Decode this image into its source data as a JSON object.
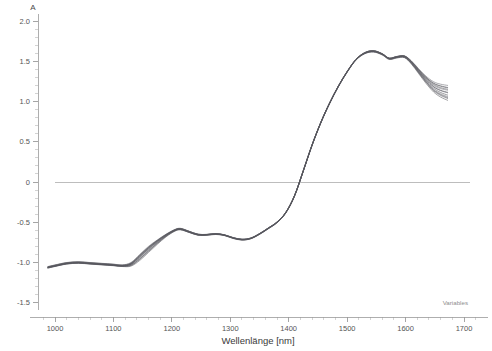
{
  "chart_data": {
    "type": "line",
    "title": "",
    "xlabel": "Wellenlänge [nm]",
    "ylabel": "A",
    "xlim": [
      960,
      1720
    ],
    "ylim": [
      -1.75,
      2.12
    ],
    "xticks": [
      1000,
      1100,
      1200,
      1300,
      1400,
      1500,
      1600,
      1700
    ],
    "xtick_labels": [
      "1000",
      "1100",
      "1200",
      "1300",
      "1400",
      "1500",
      "1600",
      "1700"
    ],
    "yticks": [
      2.0,
      1.5,
      1.0,
      0.5,
      0.0,
      -0.5,
      -1.0,
      -1.5
    ],
    "ytick_labels": [
      "2.0",
      "1.5",
      "1.0",
      "0.5",
      "0",
      "-0.5",
      "-1.0",
      "-1.5"
    ],
    "xminor_step": 20,
    "yminor_step": 0.1,
    "grid": false,
    "legend": false,
    "zero_reference_line": 0.0,
    "annotation": "Variables",
    "annotation_position": "bottom-right",
    "series_count": 12,
    "series_color": "#55555a",
    "x": [
      988,
      1000,
      1020,
      1040,
      1060,
      1080,
      1100,
      1115,
      1130,
      1145,
      1160,
      1175,
      1190,
      1205,
      1215,
      1230,
      1245,
      1260,
      1275,
      1290,
      1305,
      1320,
      1335,
      1350,
      1365,
      1380,
      1395,
      1410,
      1425,
      1440,
      1455,
      1470,
      1485,
      1500,
      1515,
      1530,
      1545,
      1560,
      1572,
      1585,
      1598,
      1610,
      1622,
      1635,
      1648,
      1660,
      1672
    ],
    "series": [
      {
        "name": "Spectrum 1",
        "values": [
          -1.06,
          -1.04,
          -1.01,
          -1.0,
          -1.01,
          -1.02,
          -1.03,
          -1.04,
          -1.02,
          -0.93,
          -0.83,
          -0.74,
          -0.66,
          -0.6,
          -0.585,
          -0.62,
          -0.655,
          -0.655,
          -0.645,
          -0.66,
          -0.695,
          -0.715,
          -0.7,
          -0.645,
          -0.575,
          -0.5,
          -0.38,
          -0.17,
          0.14,
          0.46,
          0.74,
          0.98,
          1.19,
          1.37,
          1.52,
          1.6,
          1.625,
          1.59,
          1.535,
          1.555,
          1.565,
          1.5,
          1.4,
          1.3,
          1.225,
          1.19,
          1.17
        ]
      },
      {
        "name": "Spectrum 2",
        "values": [
          -1.055,
          -1.035,
          -1.005,
          -0.995,
          -1.005,
          -1.015,
          -1.025,
          -1.035,
          -1.01,
          -0.915,
          -0.815,
          -0.73,
          -0.655,
          -0.595,
          -0.58,
          -0.615,
          -0.65,
          -0.652,
          -0.642,
          -0.658,
          -0.693,
          -0.713,
          -0.698,
          -0.642,
          -0.572,
          -0.497,
          -0.377,
          -0.167,
          0.143,
          0.462,
          0.742,
          0.982,
          1.192,
          1.372,
          1.522,
          1.605,
          1.63,
          1.592,
          1.537,
          1.557,
          1.562,
          1.49,
          1.385,
          1.275,
          1.185,
          1.14,
          1.115
        ]
      },
      {
        "name": "Spectrum 3",
        "values": [
          -1.065,
          -1.045,
          -1.015,
          -1.005,
          -1.015,
          -1.025,
          -1.035,
          -1.045,
          -1.03,
          -0.95,
          -0.85,
          -0.755,
          -0.67,
          -0.605,
          -0.59,
          -0.625,
          -0.658,
          -0.658,
          -0.648,
          -0.662,
          -0.698,
          -0.718,
          -0.702,
          -0.648,
          -0.578,
          -0.503,
          -0.383,
          -0.173,
          0.137,
          0.457,
          0.737,
          0.977,
          1.187,
          1.367,
          1.517,
          1.598,
          1.62,
          1.585,
          1.53,
          1.548,
          1.552,
          1.478,
          1.368,
          1.25,
          1.15,
          1.095,
          1.06
        ]
      },
      {
        "name": "Spectrum 4",
        "values": [
          -1.07,
          -1.05,
          -1.02,
          -1.01,
          -1.02,
          -1.03,
          -1.04,
          -1.05,
          -1.045,
          -0.975,
          -0.875,
          -0.775,
          -0.682,
          -0.612,
          -0.595,
          -0.628,
          -0.662,
          -0.662,
          -0.652,
          -0.666,
          -0.702,
          -0.722,
          -0.706,
          -0.652,
          -0.582,
          -0.507,
          -0.387,
          -0.177,
          0.133,
          0.452,
          0.732,
          0.972,
          1.182,
          1.362,
          1.512,
          1.592,
          1.615,
          1.578,
          1.522,
          1.54,
          1.545,
          1.465,
          1.35,
          1.225,
          1.118,
          1.055,
          1.015
        ]
      },
      {
        "name": "Spectrum 5",
        "values": [
          -1.05,
          -1.03,
          -1.0,
          -0.99,
          -1.0,
          -1.01,
          -1.02,
          -1.03,
          -1.0,
          -0.9,
          -0.8,
          -0.72,
          -0.648,
          -0.59,
          -0.575,
          -0.612,
          -0.648,
          -0.65,
          -0.64,
          -0.655,
          -0.69,
          -0.71,
          -0.695,
          -0.64,
          -0.57,
          -0.495,
          -0.375,
          -0.165,
          0.145,
          0.465,
          0.745,
          0.985,
          1.195,
          1.375,
          1.525,
          1.608,
          1.632,
          1.595,
          1.54,
          1.56,
          1.568,
          1.505,
          1.41,
          1.315,
          1.245,
          1.215,
          1.2
        ]
      },
      {
        "name": "Spectrum 6",
        "values": [
          -1.06,
          -1.042,
          -1.012,
          -1.002,
          -1.012,
          -1.022,
          -1.032,
          -1.042,
          -1.018,
          -0.925,
          -0.825,
          -0.738,
          -0.66,
          -0.598,
          -0.582,
          -0.618,
          -0.652,
          -0.654,
          -0.644,
          -0.659,
          -0.694,
          -0.714,
          -0.699,
          -0.644,
          -0.574,
          -0.499,
          -0.379,
          -0.169,
          0.141,
          0.46,
          0.74,
          0.98,
          1.19,
          1.37,
          1.52,
          1.602,
          1.627,
          1.59,
          1.534,
          1.553,
          1.559,
          1.487,
          1.382,
          1.272,
          1.182,
          1.135,
          1.108
        ]
      },
      {
        "name": "Spectrum 7",
        "values": [
          -1.058,
          -1.038,
          -1.008,
          -0.998,
          -1.008,
          -1.018,
          -1.028,
          -1.038,
          -1.014,
          -0.92,
          -0.818,
          -0.732,
          -0.657,
          -0.596,
          -0.581,
          -0.616,
          -0.651,
          -0.653,
          -0.643,
          -0.657,
          -0.692,
          -0.712,
          -0.697,
          -0.643,
          -0.573,
          -0.498,
          -0.378,
          -0.168,
          0.142,
          0.461,
          0.741,
          0.981,
          1.191,
          1.371,
          1.521,
          1.604,
          1.629,
          1.591,
          1.536,
          1.556,
          1.561,
          1.492,
          1.39,
          1.285,
          1.2,
          1.16,
          1.14
        ]
      },
      {
        "name": "Spectrum 8",
        "values": [
          -1.068,
          -1.048,
          -1.018,
          -1.008,
          -1.018,
          -1.028,
          -1.038,
          -1.048,
          -1.038,
          -0.962,
          -0.862,
          -0.765,
          -0.676,
          -0.608,
          -0.592,
          -0.627,
          -0.66,
          -0.66,
          -0.65,
          -0.664,
          -0.7,
          -0.72,
          -0.704,
          -0.65,
          -0.58,
          -0.505,
          -0.385,
          -0.175,
          0.135,
          0.455,
          0.735,
          0.975,
          1.185,
          1.365,
          1.515,
          1.595,
          1.617,
          1.581,
          1.526,
          1.544,
          1.548,
          1.471,
          1.359,
          1.238,
          1.134,
          1.075,
          1.038
        ]
      },
      {
        "name": "Spectrum 9",
        "values": [
          -1.062,
          -1.044,
          -1.014,
          -1.004,
          -1.014,
          -1.024,
          -1.034,
          -1.044,
          -1.024,
          -0.938,
          -0.838,
          -0.748,
          -0.666,
          -0.602,
          -0.587,
          -0.622,
          -0.656,
          -0.656,
          -0.646,
          -0.66,
          -0.696,
          -0.716,
          -0.701,
          -0.646,
          -0.576,
          -0.501,
          -0.381,
          -0.171,
          0.139,
          0.458,
          0.738,
          0.978,
          1.188,
          1.368,
          1.518,
          1.6,
          1.622,
          1.587,
          1.532,
          1.55,
          1.555,
          1.482,
          1.374,
          1.26,
          1.165,
          1.112,
          1.08
        ]
      },
      {
        "name": "Spectrum 10",
        "values": [
          -1.052,
          -1.032,
          -1.002,
          -0.992,
          -1.002,
          -1.012,
          -1.022,
          -1.032,
          -1.005,
          -0.908,
          -0.808,
          -0.725,
          -0.652,
          -0.592,
          -0.578,
          -0.614,
          -0.649,
          -0.651,
          -0.641,
          -0.656,
          -0.691,
          -0.711,
          -0.696,
          -0.641,
          -0.571,
          -0.496,
          -0.376,
          -0.166,
          0.144,
          0.464,
          0.744,
          0.984,
          1.194,
          1.374,
          1.524,
          1.607,
          1.631,
          1.594,
          1.539,
          1.559,
          1.566,
          1.5,
          1.402,
          1.302,
          1.228,
          1.195,
          1.175
        ]
      },
      {
        "name": "Spectrum 11",
        "values": [
          -1.064,
          -1.046,
          -1.016,
          -1.006,
          -1.016,
          -1.026,
          -1.036,
          -1.046,
          -1.034,
          -0.956,
          -0.856,
          -0.76,
          -0.673,
          -0.606,
          -0.59,
          -0.625,
          -0.659,
          -0.659,
          -0.649,
          -0.663,
          -0.699,
          -0.719,
          -0.703,
          -0.649,
          -0.579,
          -0.504,
          -0.384,
          -0.174,
          0.136,
          0.456,
          0.736,
          0.976,
          1.186,
          1.366,
          1.516,
          1.596,
          1.619,
          1.583,
          1.528,
          1.546,
          1.55,
          1.475,
          1.364,
          1.245,
          1.142,
          1.085,
          1.048
        ]
      },
      {
        "name": "Spectrum 12",
        "values": [
          -1.056,
          -1.036,
          -1.006,
          -0.996,
          -1.006,
          -1.016,
          -1.026,
          -1.036,
          -1.012,
          -0.912,
          -0.812,
          -0.728,
          -0.654,
          -0.594,
          -0.579,
          -0.615,
          -0.65,
          -0.652,
          -0.642,
          -0.657,
          -0.692,
          -0.712,
          -0.697,
          -0.642,
          -0.572,
          -0.497,
          -0.377,
          -0.167,
          0.143,
          0.462,
          0.742,
          0.982,
          1.192,
          1.372,
          1.522,
          1.606,
          1.63,
          1.593,
          1.538,
          1.558,
          1.564,
          1.497,
          1.396,
          1.292,
          1.212,
          1.172,
          1.152
        ]
      }
    ]
  }
}
